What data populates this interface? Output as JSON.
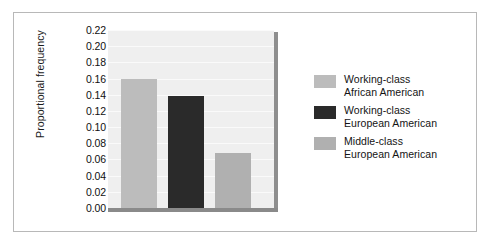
{
  "chart_data": {
    "type": "bar",
    "title": "",
    "subtitle": "",
    "xlabel": "",
    "ylabel": "Proportional frequency",
    "categories": [
      "Working-class African American",
      "Working-class European American",
      "Middle-class European American"
    ],
    "values": [
      0.16,
      0.139,
      0.068
    ],
    "ylim": [
      0.0,
      0.22
    ],
    "ytick_step": 0.02,
    "ytick_labels": [
      "0.22",
      "0.20",
      "0.18",
      "0.16",
      "0.14",
      "0.12",
      "0.10",
      "0.08",
      "0.06",
      "0.04",
      "0.02",
      "0.00"
    ],
    "ytick_values": [
      0.22,
      0.2,
      0.18,
      0.16,
      0.14,
      0.12,
      0.1,
      0.08,
      0.06,
      0.04,
      0.02,
      0.0
    ],
    "xtick_labels": [],
    "grid": true,
    "legend_position": "right",
    "legend": [
      {
        "line1": "Working-class",
        "line2": "African American",
        "color": "#bcbcbc"
      },
      {
        "line1": "Working-class",
        "line2": "European American",
        "color": "#2a2a2a"
      },
      {
        "line1": "Middle-class",
        "line2": "European American",
        "color": "#b0b0b0"
      }
    ],
    "series": [
      {
        "name": "Proportional frequency",
        "points": [
          {
            "label": "Working-class African American",
            "value": 0.16,
            "color": "#bcbcbc"
          },
          {
            "label": "Working-class European American",
            "value": 0.139,
            "color": "#2a2a2a"
          },
          {
            "label": "Middle-class European American",
            "value": 0.068,
            "color": "#b0b0b0"
          }
        ]
      }
    ],
    "colors": {
      "plot_background": "#efefef",
      "gridline": "#fafafa",
      "axis_line": "#8a8a8a",
      "frame_border": "#b8b8b8",
      "text": "#141414"
    }
  }
}
